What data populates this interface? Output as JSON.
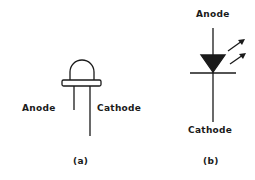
{
  "figure": {
    "panel_a": {
      "caption": "(a)",
      "description": "LED physical package",
      "labels": {
        "anode": "Anode",
        "cathode": "Cathode"
      }
    },
    "panel_b": {
      "caption": "(b)",
      "description": "LED schematic symbol",
      "labels": {
        "anode": "Anode",
        "cathode": "Cathode"
      }
    }
  },
  "colors": {
    "ink": "#1a1a1a",
    "background": "#ffffff"
  }
}
